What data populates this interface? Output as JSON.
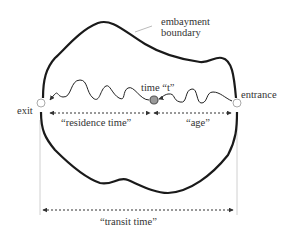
{
  "diagram": {
    "boundary_label_line1": "embayment",
    "boundary_label_line2": "boundary",
    "time_label": "time “t”",
    "entrance_label": "entrance",
    "exit_label": "exit",
    "residence_label": "“residence time”",
    "age_label": "“age”",
    "transit_label": "“transit time”"
  },
  "colors": {
    "boundary": "#1a1a1a",
    "path": "#222222",
    "arrow": "#333333",
    "guide": "#bbbbbb",
    "marker_fill": "#999999"
  }
}
